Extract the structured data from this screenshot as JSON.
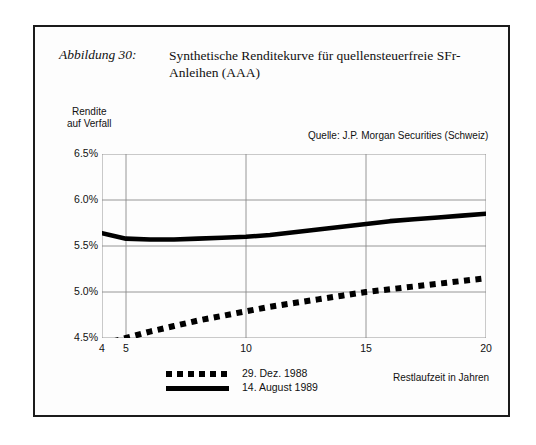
{
  "figure": {
    "label": "Abbildung 30:",
    "title_line1": "Synthetische Renditekurve für quellensteuerfreie SFr-",
    "title_line2": "Anleihen (AAA)"
  },
  "chart_data": {
    "type": "line",
    "title": "Synthetische Renditekurve für quellensteuerfreie SFr-Anleihen (AAA)",
    "source": "Quelle: J.P. Morgan Securities (Schweiz)",
    "xlabel": "Restlaufzeit in Jahren",
    "ylabel": "Rendite auf Verfall",
    "xlim": [
      4,
      20
    ],
    "ylim": [
      4.5,
      6.5
    ],
    "xticks": [
      4,
      5,
      10,
      15,
      20
    ],
    "xtick_labels": [
      "4",
      "5",
      "10",
      "15",
      "20"
    ],
    "yticks": [
      4.5,
      5.0,
      5.5,
      6.0,
      6.5
    ],
    "ytick_labels": [
      "4.5%",
      "5.0%",
      "5.5%",
      "6.0%",
      "6.5%"
    ],
    "grid": true,
    "legend_position": "below-left",
    "series": [
      {
        "name": "29. Dez. 1988",
        "style": "dotted",
        "color": "#000000",
        "x": [
          4,
          5,
          6,
          7,
          8,
          9,
          10,
          11,
          12,
          13,
          14,
          15,
          16,
          17,
          18,
          19,
          20
        ],
        "values": [
          4.43,
          4.5,
          4.57,
          4.63,
          4.69,
          4.74,
          4.79,
          4.84,
          4.88,
          4.92,
          4.96,
          5.0,
          5.03,
          5.06,
          5.09,
          5.12,
          5.15
        ]
      },
      {
        "name": "14. August 1989",
        "style": "solid",
        "color": "#000000",
        "x": [
          4,
          5,
          6,
          7,
          8,
          9,
          10,
          11,
          12,
          13,
          14,
          15,
          16,
          17,
          18,
          19,
          20
        ],
        "values": [
          5.64,
          5.58,
          5.57,
          5.57,
          5.58,
          5.59,
          5.6,
          5.62,
          5.65,
          5.68,
          5.71,
          5.74,
          5.77,
          5.79,
          5.81,
          5.83,
          5.85
        ]
      }
    ]
  }
}
